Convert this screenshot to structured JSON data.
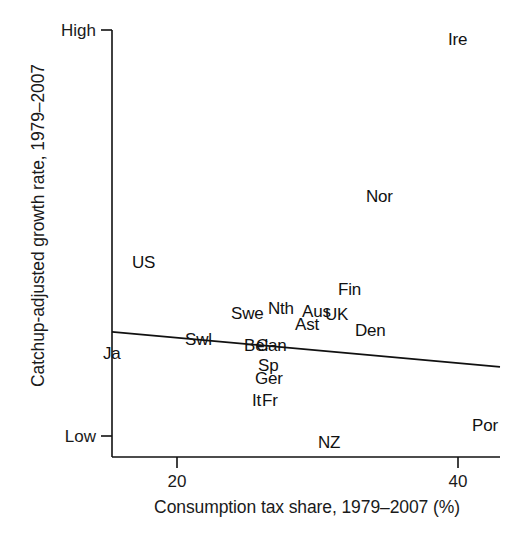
{
  "chart_data": {
    "type": "scatter",
    "title": "",
    "subtitle": "",
    "xlabel": "Consumption tax share, 1979–2007 (%)",
    "ylabel": "Catchup-adjusted growth rate, 1979–2007",
    "xlim": [
      16.4,
      43.6
    ],
    "ylim": [
      0,
      1
    ],
    "grid": false,
    "legend": null,
    "xticks": [
      {
        "value": 20,
        "label": "20"
      },
      {
        "value": 40,
        "label": "40"
      }
    ],
    "yticks": [
      {
        "value": 1.0,
        "label": "High"
      },
      {
        "value": 0.05,
        "label": "Low"
      }
    ],
    "marker_style": "text-label-only",
    "points": [
      {
        "label": "Ire",
        "x": 44.0,
        "y": 0.975
      },
      {
        "label": "Nor",
        "x": 33.6,
        "y": 0.617
      },
      {
        "label": "US",
        "x": 22.4,
        "y": 0.458
      },
      {
        "label": "Fin",
        "x": 32.2,
        "y": 0.367
      },
      {
        "label": "Nth",
        "x": 27.6,
        "y": 0.32
      },
      {
        "label": "Swe",
        "x": 25.5,
        "y": 0.307
      },
      {
        "label": "Aus",
        "x": 29.4,
        "y": 0.305
      },
      {
        "label": "UK",
        "x": 30.7,
        "y": 0.3
      },
      {
        "label": "Ast",
        "x": 28.6,
        "y": 0.268
      },
      {
        "label": "Den",
        "x": 31.7,
        "y": 0.25
      },
      {
        "label": "Swl",
        "x": 23.6,
        "y": 0.233
      },
      {
        "label": "Bel",
        "x": 26.4,
        "y": 0.215
      },
      {
        "label": "Can",
        "x": 27.5,
        "y": 0.215
      },
      {
        "label": "Ja",
        "x": 19.2,
        "y": 0.2
      },
      {
        "label": "Sp",
        "x": 27.0,
        "y": 0.172
      },
      {
        "label": "Ger",
        "x": 27.2,
        "y": 0.137
      },
      {
        "label": "It",
        "x": 26.6,
        "y": 0.092
      },
      {
        "label": "Fr",
        "x": 27.2,
        "y": 0.092
      },
      {
        "label": "Por",
        "x": 41.6,
        "y": 0.052
      },
      {
        "label": "NZ",
        "x": 30.2,
        "y": 0.022
      }
    ],
    "fit_line": {
      "name": "linear fit",
      "x_start": 16.4,
      "y_start": 0.293,
      "x_end": 43.6,
      "y_end": 0.211,
      "color": "#111111",
      "width": 1.8
    }
  },
  "axes": {
    "x_title": "Consumption tax share, 1979–2007 (%)",
    "y_title": "Catchup-adjusted growth rate, 1979–2007",
    "y_tick_high": "High",
    "y_tick_low": "Low",
    "x_tick_20": "20",
    "x_tick_40": "40",
    "axis_color": "#111111"
  },
  "labels": {
    "ire": "Ire",
    "nor": "Nor",
    "us": "US",
    "fin": "Fin",
    "nth": "Nth",
    "swe": "Swe",
    "aus": "Aus",
    "uk": "UK",
    "ast": "Ast",
    "den": "Den",
    "swl": "Swl",
    "bel": "Bel",
    "can": "Can",
    "ja": "Ja",
    "sp": "Sp",
    "ger": "Ger",
    "it": "It",
    "fr": "Fr",
    "por": "Por",
    "nz": "NZ"
  },
  "caption": {
    "text": ""
  }
}
